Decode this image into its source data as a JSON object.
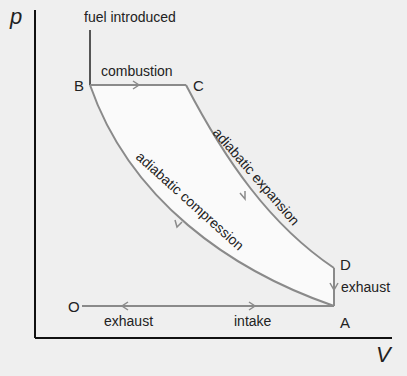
{
  "diagram": {
    "type": "pressure-volume cycle diagram",
    "axes": {
      "y_label": "p",
      "x_label": "V"
    },
    "points": {
      "B": "B",
      "C": "C",
      "D": "D",
      "A": "A",
      "O": "O"
    },
    "labels": {
      "fuel": "fuel introduced",
      "combustion": "combustion",
      "adiabatic_expansion": "adiabatic expansion",
      "adiabatic_compression": "adiabatic compression",
      "exhaust_right": "exhaust",
      "exhaust_bottom": "exhaust",
      "intake": "intake"
    },
    "colors": {
      "cycle_line": "#8a8a8a",
      "fill": "#fafafa",
      "axis": "#111111",
      "background": "#efefef"
    }
  }
}
